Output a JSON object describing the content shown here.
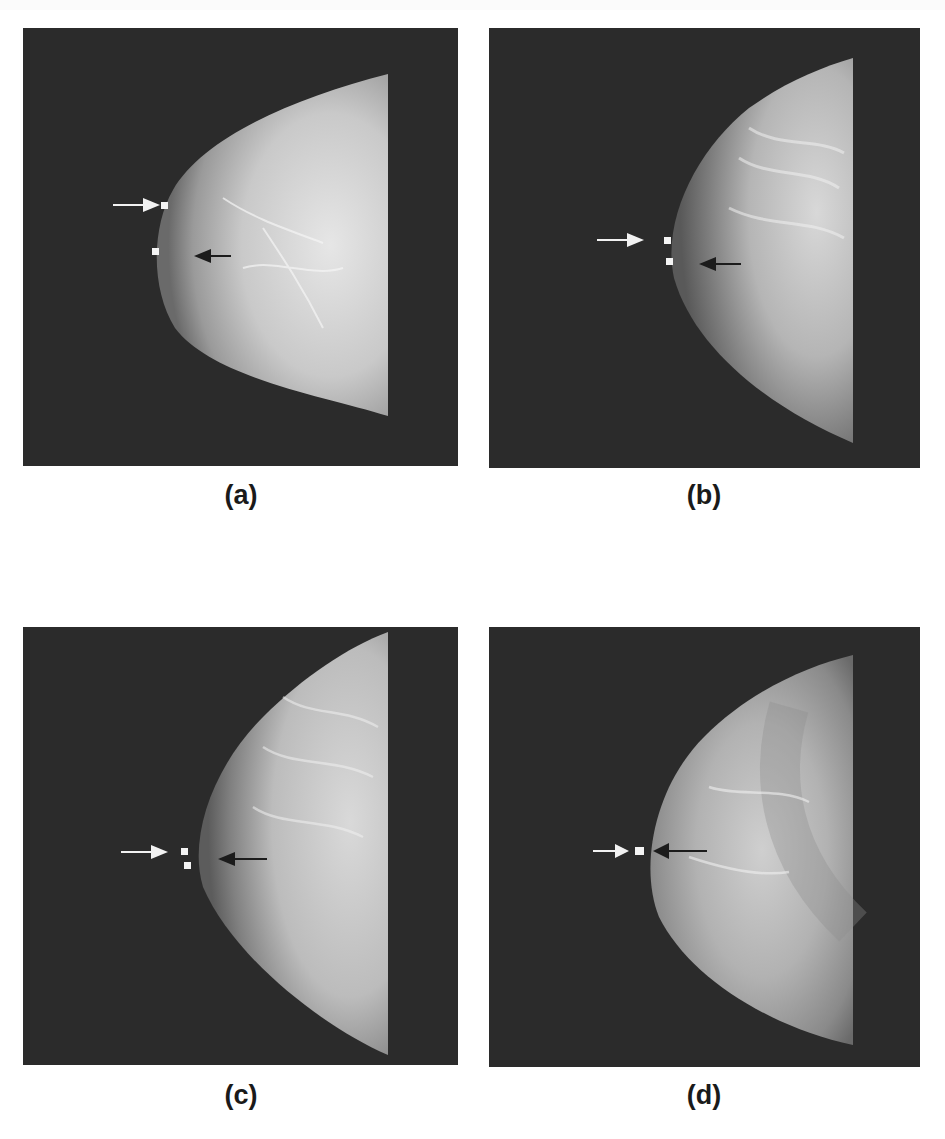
{
  "figure": {
    "panels": [
      {
        "id": "a",
        "caption": "(a)"
      },
      {
        "id": "b",
        "caption": "(b)"
      },
      {
        "id": "c",
        "caption": "(c)"
      },
      {
        "id": "d",
        "caption": "(d)"
      }
    ],
    "annotations": {
      "white_arrow_color": "#f2f2f2",
      "black_arrow_color": "#1c1c1c",
      "marker_color": "#f4f4f4",
      "background_color": "#2b2b2b"
    }
  }
}
